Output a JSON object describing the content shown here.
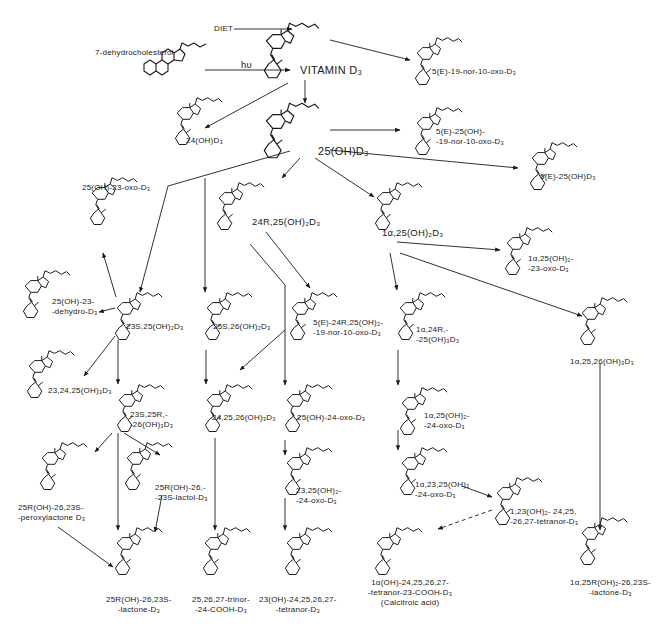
{
  "diagram": {
    "inputs": {
      "diet": "DIET",
      "precursor": "7-dehydrocholesterol",
      "light": "hυ"
    },
    "compounds": [
      {
        "id": "vitd3",
        "label": "VITAMIN D₃",
        "x": 258,
        "y": 20,
        "lx": 300,
        "ly": 64,
        "size": "big"
      },
      {
        "id": "c7dhc",
        "label": "",
        "x": 140,
        "y": 40,
        "lx": 0,
        "ly": 0,
        "size": "small",
        "steroid": true
      },
      {
        "id": "nor10oxo",
        "label": "5(E)-19-nor-10-oxo-D₃",
        "x": 410,
        "y": 35,
        "lx": 432,
        "ly": 67,
        "size": "small"
      },
      {
        "id": "oh24",
        "label": "24(OH)D₃",
        "x": 170,
        "y": 95,
        "lx": 186,
        "ly": 136,
        "size": "small"
      },
      {
        "id": "oh25",
        "label": "25(OH)D₃",
        "x": 258,
        "y": 100,
        "lx": 318,
        "ly": 145,
        "size": "big"
      },
      {
        "id": "nor25",
        "label": "5(E)-25(OH)-\n-19-nor-10-oxo-D₃",
        "x": 410,
        "y": 105,
        "lx": 436,
        "ly": 127,
        "size": "small"
      },
      {
        "id": "e25",
        "label": "5(E)-25(OH)D₃",
        "x": 525,
        "y": 140,
        "lx": 540,
        "ly": 172,
        "size": "small"
      },
      {
        "id": "oxo23",
        "label": "25(OH)-23-oxo-D₃",
        "x": 85,
        "y": 175,
        "lx": 82,
        "ly": 183,
        "size": "small"
      },
      {
        "id": "r24",
        "label": "24R,25(OH)₂D₃",
        "x": 212,
        "y": 180,
        "lx": 252,
        "ly": 216,
        "size": "mid"
      },
      {
        "id": "a125",
        "label": "1α,25(OH)₂D₃",
        "x": 370,
        "y": 180,
        "lx": 382,
        "ly": 227,
        "size": "mid"
      },
      {
        "id": "a125oxo23",
        "label": "1α,25(OH)₂-\n-23-oxo-D₃",
        "x": 500,
        "y": 225,
        "lx": 528,
        "ly": 254,
        "size": "small"
      },
      {
        "id": "dehydro23",
        "label": "25(OH)-23-\n-dehydro-D₃",
        "x": 18,
        "y": 268,
        "lx": 52,
        "ly": 297,
        "size": "small"
      },
      {
        "id": "s2325",
        "label": "23S,25(OH)₂D₃",
        "x": 110,
        "y": 290,
        "lx": 126,
        "ly": 322,
        "size": "small"
      },
      {
        "id": "s2526",
        "label": "25S,26(OH)₂D₃",
        "x": 200,
        "y": 290,
        "lx": 213,
        "ly": 322,
        "size": "small"
      },
      {
        "id": "e24r25",
        "label": "5(E)-24R,25(OH)₂-\n-19-nor-10-oxo-D₃",
        "x": 285,
        "y": 290,
        "lx": 313,
        "ly": 318,
        "size": "small"
      },
      {
        "id": "a12425",
        "label": "1α,24R,-\n-25(OH)₃D₃",
        "x": 393,
        "y": 290,
        "lx": 416,
        "ly": 325,
        "size": "small"
      },
      {
        "id": "a12526",
        "label": "1α,25,26(OH)₃D₃",
        "x": 575,
        "y": 295,
        "lx": 570,
        "ly": 357,
        "size": "small"
      },
      {
        "id": "t232425",
        "label": "23,24,25(OH)₃D₃",
        "x": 22,
        "y": 348,
        "lx": 48,
        "ly": 386,
        "size": "small"
      },
      {
        "id": "s23r25r26",
        "label": "23S,25R,-\n-26(OH)₃D₃",
        "x": 112,
        "y": 382,
        "lx": 130,
        "ly": 410,
        "size": "small"
      },
      {
        "id": "t242526",
        "label": "24,25,26(OH)₃D₃",
        "x": 200,
        "y": 382,
        "lx": 212,
        "ly": 413,
        "size": "small"
      },
      {
        "id": "oxo24",
        "label": "25(OH)-24-oxo-D₃",
        "x": 280,
        "y": 382,
        "lx": 297,
        "ly": 413,
        "size": "small"
      },
      {
        "id": "a125oxo24",
        "label": "1α,25(OH)₂-\n-24-oxo-D₃",
        "x": 395,
        "y": 385,
        "lx": 424,
        "ly": 411,
        "size": "small"
      },
      {
        "id": "peroxy",
        "label": "25R(OH)-26,23S-\n-peroxylactone D₃",
        "x": 35,
        "y": 440,
        "lx": 18,
        "ly": 503,
        "size": "small"
      },
      {
        "id": "lactol",
        "label": "25R(OH)-26,-\n-23S-lactol-D₃",
        "x": 120,
        "y": 440,
        "lx": 155,
        "ly": 483,
        "size": "small"
      },
      {
        "id": "d2325oxo24",
        "label": "23,25(OH)₂-\n-24-oxo-D₃",
        "x": 280,
        "y": 445,
        "lx": 296,
        "ly": 486,
        "size": "small"
      },
      {
        "id": "a12325oxo24",
        "label": "1α,23,25(OH)₃\n-24-oxo-D₃",
        "x": 395,
        "y": 445,
        "lx": 415,
        "ly": 480,
        "size": "small"
      },
      {
        "id": "tetranor1",
        "label": "1,23(OH)₂- 24,25,\n-26,27-tetranor-D₃",
        "x": 490,
        "y": 475,
        "lx": 510,
        "ly": 507,
        "size": "small"
      },
      {
        "id": "lactone",
        "label": "25R(OH)-26,23S-\n-lactone-D₃",
        "x": 110,
        "y": 525,
        "lx": 106,
        "ly": 595,
        "size": "small",
        "center": true
      },
      {
        "id": "trinor",
        "label": "25,26,27-trinor-\n-24-COOH-D₃",
        "x": 198,
        "y": 525,
        "lx": 192,
        "ly": 595,
        "size": "small",
        "center": true
      },
      {
        "id": "tetranor23",
        "label": "23(OH)-24,25,26,27-\n-tetranor-D₃",
        "x": 280,
        "y": 525,
        "lx": 259,
        "ly": 595,
        "size": "small",
        "center": true
      },
      {
        "id": "calcitroic",
        "label": "1α(OH)-24,25,26,27-\n-tetranor-23-COOH-D₃\n(Calcitroic acid)",
        "x": 370,
        "y": 525,
        "lx": 368,
        "ly": 578,
        "size": "small",
        "center": true
      },
      {
        "id": "a125lactone",
        "label": "1α,25R(OH)₂-26,23S-\n-lactone-D₃",
        "x": 575,
        "y": 515,
        "lx": 570,
        "ly": 578,
        "size": "small",
        "center": true
      }
    ],
    "arrows": [
      {
        "from": "diet",
        "x1": 234,
        "y1": 29,
        "x2": 292,
        "y2": 29
      },
      {
        "from": "light",
        "x1": 205,
        "y1": 70,
        "x2": 290,
        "y2": 70
      },
      {
        "from": "vitd3",
        "to": "nor10oxo",
        "x1": 330,
        "y1": 40,
        "x2": 410,
        "y2": 60
      },
      {
        "from": "vitd3",
        "to": "oh24",
        "x1": 288,
        "y1": 83,
        "x2": 205,
        "y2": 128
      },
      {
        "from": "vitd3",
        "to": "oh25",
        "x1": 305,
        "y1": 80,
        "x2": 305,
        "y2": 103
      },
      {
        "from": "oh25",
        "to": "nor25",
        "x1": 330,
        "y1": 130,
        "x2": 400,
        "y2": 130
      },
      {
        "from": "oh25",
        "to": "e25",
        "x1": 330,
        "y1": 150,
        "x2": 518,
        "y2": 168
      },
      {
        "from": "oh25",
        "to": "r24",
        "x1": 300,
        "y1": 158,
        "x2": 282,
        "y2": 178
      },
      {
        "from": "oh25",
        "to": "a125",
        "x1": 315,
        "y1": 158,
        "x2": 374,
        "y2": 197
      },
      {
        "from": "oh25",
        "to": "s2325",
        "x1": 290,
        "y1": 151,
        "x2": 168,
        "y2": 186,
        "x3": 140,
        "y3": 292
      },
      {
        "from": "oh25",
        "to": "s2526",
        "x1": 205,
        "y1": 178,
        "x2": 205,
        "y2": 292
      },
      {
        "from": "r24",
        "to": "e24r25",
        "x1": 266,
        "y1": 232,
        "x2": 310,
        "y2": 288
      },
      {
        "from": "r24",
        "to": "t242526",
        "x1": 250,
        "y1": 244,
        "x2": 285,
        "y2": 285,
        "x3": 285,
        "y3": 385
      },
      {
        "from": "a125",
        "to": "a125oxo23",
        "x1": 397,
        "y1": 242,
        "x2": 500,
        "y2": 250
      },
      {
        "from": "a125",
        "to": "a12425",
        "x1": 390,
        "y1": 253,
        "x2": 397,
        "y2": 290
      },
      {
        "from": "a125",
        "to": "a12526",
        "x1": 400,
        "y1": 253,
        "x2": 582,
        "y2": 316
      },
      {
        "from": "s2325",
        "to": "oxo23",
        "x1": 116,
        "y1": 297,
        "x2": 103,
        "y2": 253
      },
      {
        "from": "s2325",
        "to": "dehydro23",
        "x1": 115,
        "y1": 308,
        "x2": 99,
        "y2": 312
      },
      {
        "from": "s2325",
        "to": "t232425",
        "x1": 115,
        "y1": 336,
        "x2": 84,
        "y2": 376
      },
      {
        "from": "s2325",
        "to": "s23r25r26",
        "x1": 118,
        "y1": 340,
        "x2": 118,
        "y2": 384
      },
      {
        "from": "s2526",
        "to": "t242526",
        "x1": 206,
        "y1": 350,
        "x2": 206,
        "y2": 384
      },
      {
        "from": "e24r25",
        "to": "t242526",
        "x1": 285,
        "y1": 330,
        "x2": 240,
        "y2": 370
      },
      {
        "from": "a12425",
        "to": "a125oxo24",
        "x1": 398,
        "y1": 350,
        "x2": 398,
        "y2": 385
      },
      {
        "from": "oxo24",
        "to": "d2325oxo24",
        "x1": 285,
        "y1": 440,
        "x2": 285,
        "y2": 455
      },
      {
        "from": "a125oxo24",
        "to": "a12325oxo24",
        "x1": 398,
        "y1": 430,
        "x2": 398,
        "y2": 450
      },
      {
        "from": "s23r25r26",
        "to": "peroxy",
        "x1": 112,
        "y1": 433,
        "x2": 95,
        "y2": 452
      },
      {
        "from": "s23r25r26",
        "to": "lactol",
        "x1": 124,
        "y1": 433,
        "x2": 160,
        "y2": 455
      },
      {
        "from": "s23r25r26",
        "to": "lactone",
        "x1": 118,
        "y1": 433,
        "x2": 118,
        "y2": 530
      },
      {
        "from": "lactol",
        "to": "lactone",
        "x1": 162,
        "y1": 495,
        "x2": 155,
        "y2": 532
      },
      {
        "from": "peroxy",
        "to": "lactone",
        "x1": 58,
        "y1": 527,
        "x2": 113,
        "y2": 567
      },
      {
        "from": "t242526",
        "to": "trinor",
        "x1": 215,
        "y1": 438,
        "x2": 215,
        "y2": 530
      },
      {
        "from": "d2325oxo24",
        "to": "tetranor23",
        "x1": 285,
        "y1": 498,
        "x2": 285,
        "y2": 530
      },
      {
        "from": "a12325oxo24",
        "to": "tetranor1",
        "x1": 462,
        "y1": 486,
        "x2": 492,
        "y2": 497
      },
      {
        "from": "tetranor1",
        "to": "calcitroic",
        "x1": 492,
        "y1": 510,
        "x2": 438,
        "y2": 529,
        "dashed": true
      },
      {
        "from": "a12526",
        "to": "a125lactone",
        "x1": 600,
        "y1": 363,
        "x2": 600,
        "y2": 530
      }
    ]
  }
}
